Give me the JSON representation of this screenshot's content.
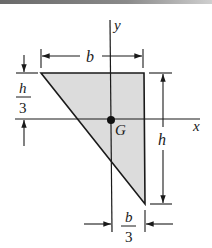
{
  "figure": {
    "shape": "right triangle",
    "fill_color": "#dcdcdc",
    "line_color": "#1a1a1a",
    "labels": {
      "y_axis": "y",
      "x_axis": "x",
      "centroid": "G",
      "width": "b",
      "height": "h",
      "offset_top_num": "h",
      "offset_top_den": "3",
      "offset_bottom_num": "b",
      "offset_bottom_den": "3"
    }
  }
}
